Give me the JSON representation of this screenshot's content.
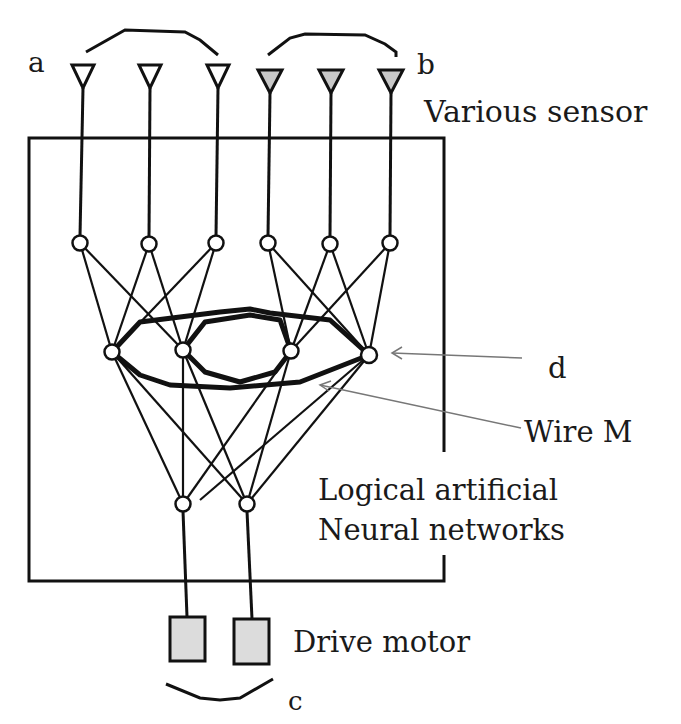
{
  "labels": {
    "a": "a",
    "b": "b",
    "c": "c",
    "d": "d",
    "sensor": "Various sensor",
    "wire": "Wire M",
    "network_line1": "Logical artificial",
    "network_line2": "Neural networks",
    "motor": "Drive motor"
  },
  "colors": {
    "stroke": "#111111",
    "sensor_fill_b": "#c8c8c8",
    "motor_fill": "#dcdcdc",
    "arrow": "#777777"
  },
  "sensors": {
    "group_a": [
      {
        "x": 83,
        "filled": false
      },
      {
        "x": 150,
        "filled": false
      },
      {
        "x": 218,
        "filled": false
      }
    ],
    "group_b": [
      {
        "x": 270,
        "filled": true
      },
      {
        "x": 331,
        "filled": true
      },
      {
        "x": 391,
        "filled": true
      }
    ]
  },
  "nodes": {
    "input_layer": [
      [
        80,
        243
      ],
      [
        149,
        244
      ],
      [
        216,
        243
      ],
      [
        268,
        243
      ],
      [
        330,
        244
      ],
      [
        390,
        243
      ]
    ],
    "hidden_layer": [
      [
        112,
        352
      ],
      [
        183,
        350
      ],
      [
        291,
        351
      ],
      [
        369,
        355
      ]
    ],
    "output_layer": [
      [
        183,
        504
      ],
      [
        247,
        504
      ]
    ]
  },
  "motors": [
    {
      "x": 170,
      "y": 617,
      "w": 35,
      "h": 44
    },
    {
      "x": 234,
      "y": 619,
      "w": 35,
      "h": 45
    }
  ]
}
